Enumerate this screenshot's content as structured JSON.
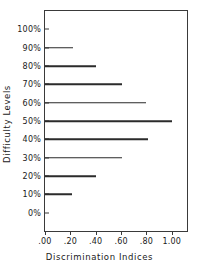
{
  "chart_data": {
    "type": "bar",
    "orientation": "horizontal",
    "title": "",
    "xlabel": "Discrimination Indices",
    "ylabel": "Difficulty Levels",
    "categories": [
      "100%",
      "90%",
      "80%",
      "70%",
      "60%",
      "50%",
      "40%",
      "30%",
      "20%",
      "10%",
      "0%"
    ],
    "values": [
      0.0,
      0.22,
      0.4,
      0.61,
      0.8,
      1.0,
      0.81,
      0.61,
      0.4,
      0.21,
      0.0
    ],
    "xlim": [
      0.0,
      1.12
    ],
    "xticks": [
      0.0,
      0.2,
      0.4,
      0.6,
      0.8,
      1.0
    ],
    "xticklabels": [
      ".00",
      ".20",
      ".40",
      ".60",
      ".80",
      "1.00"
    ],
    "grid": false,
    "legend": false,
    "bar_color": "#2b2b2b",
    "frame_color": "#3a3a3a",
    "background": "#ffffff"
  }
}
